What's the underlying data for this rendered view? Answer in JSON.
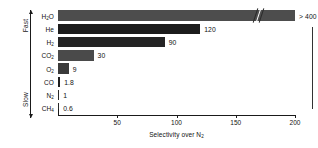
{
  "chart_data": {
    "type": "bar",
    "orientation": "horizontal",
    "title": "",
    "xlabel": "Selectivity over N2",
    "xlabel_display": "Selectivity over N",
    "xlabel_sub": "2",
    "ylabel": "",
    "categories": [
      "H2O",
      "He",
      "H2",
      "CO2",
      "O2",
      "CO",
      "N2",
      "CH4"
    ],
    "category_labels": [
      {
        "base": "H",
        "sub": "2",
        "tail": "O"
      },
      {
        "base": "He",
        "sub": "",
        "tail": ""
      },
      {
        "base": "H",
        "sub": "2",
        "tail": ""
      },
      {
        "base": "CO",
        "sub": "2",
        "tail": ""
      },
      {
        "base": "O",
        "sub": "2",
        "tail": ""
      },
      {
        "base": "CO",
        "sub": "",
        "tail": ""
      },
      {
        "base": "N",
        "sub": "2",
        "tail": ""
      },
      {
        "base": "CH",
        "sub": "4",
        "tail": ""
      }
    ],
    "values": [
      400,
      120,
      90,
      30,
      9,
      1.8,
      1,
      0.6
    ],
    "value_labels": [
      "> 400",
      "120",
      "90",
      "30",
      "9",
      "1.8",
      "1",
      "0.6"
    ],
    "bar_colors": [
      "#4d4d4d",
      "#1c1c1c",
      "#242424",
      "#4a4a4a",
      "#3a3a3a",
      "#1e1e1e",
      "#2a2a2a",
      "#2a2a2a"
    ],
    "xlim": [
      0,
      200
    ],
    "xticks": [
      50,
      100,
      150,
      200
    ],
    "xtick_labels": [
      "50",
      "100",
      "150",
      "200"
    ],
    "grid": false,
    "axis_break": true,
    "axis_break_note": "H2O bar is truncated with a broken-axis mark near 190",
    "speed_axis": {
      "top_label": "Fast",
      "bottom_label": "Slow"
    },
    "annotations": [
      "H2O selectivity exceeds 400 and is shown with a broken bar"
    ]
  }
}
